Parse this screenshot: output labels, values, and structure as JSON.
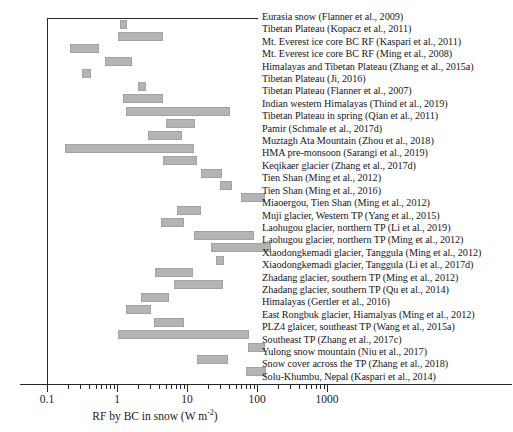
{
  "chart_data": {
    "type": "bar",
    "orientation": "horizontal",
    "title": "",
    "xlabel": "RF by BC in snow (W m-2)",
    "ylabel": "",
    "xscale": "log",
    "xlim": [
      0.1,
      1000
    ],
    "xticks": [
      0.1,
      1,
      10,
      100,
      1000
    ],
    "xticklabels": [
      "0.1",
      "1",
      "10",
      "100",
      "1000"
    ],
    "grid": false,
    "legend": "right-side study labels, one per row",
    "note": "Each row is a study; the bar spans the reported range of radiative forcing (W m-2).",
    "categories": [
      "Eurasia snow (Flanner et al., 2009)",
      "Tibetan Plateau (Kopacz et al., 2011)",
      "Mt. Everest ice core BC RF (Kaspari et al., 2011)",
      "Mt. Everest ice core BC RF (Ming et al., 2008)",
      "Himalayas and Tibetan Plateau (Zhang et al., 2015a)",
      "Tibetan Plateau (Ji, 2016)",
      "Tibetan Plateau (Flanner et al., 2007)",
      "Indian western Himalayas (Thind et al., 2019)",
      "Tibetan Plateau in spring (Qian et al., 2011)",
      "Pamir (Schmale et al., 2017d)",
      "Muztagh Ata Mountain (Zhou et al., 2018)",
      "HMA pre-monsoon (Sarangi et al., 2019)",
      "Keqikaer glacier (Zhang et al., 2017d)",
      "Tien Shan (Ming et al., 2012)",
      "Tien Shan (Ming et al., 2016)",
      "Miaoergou, Tien Shan (Ming et al., 2012)",
      "Muji glacier, Western TP (Yang et al., 2015)",
      "Laohugou glacier, northern TP (Li et al., 2019)",
      "Laohugou glacier, northern TP (Ming et al., 2012)",
      "Xiaodongkemadi glacier, Tanggula (Ming et al., 2012)",
      "Xiaodongkemadi glacier, Tanggula (Li et al., 2017d)",
      "Zhadang glacier, southern TP (Ming et al., 2012)",
      "Zhadang glacier, southern TP (Qu et al., 2014)",
      "Himalayas (Gertler et al., 2016)",
      "East Rongbuk glacier, Hiamalyas (Ming et al., 2012)",
      "PLZ4 glaicer, southeast TP (Wang et al., 2015a)",
      "Southeast TP (Zhang et al., 2017c)",
      "Yulong snow mountain (Niu et al., 2017)",
      "Snow cover across the TP (Zhang et al., 2018)",
      "Solu-Khumbu, Nepal (Kaspari et al., 2014)"
    ],
    "ranges": [
      [
        1.1,
        1.4
      ],
      [
        1.05,
        4.6
      ],
      [
        0.21,
        0.56
      ],
      [
        0.68,
        1.65
      ],
      [
        0.32,
        0.42
      ],
      [
        2.0,
        2.5
      ],
      [
        1.2,
        4.5
      ],
      [
        1.35,
        41.0
      ],
      [
        5.0,
        13.0
      ],
      [
        2.8,
        8.5
      ],
      [
        0.18,
        12.5
      ],
      [
        4.5,
        14.0
      ],
      [
        16.0,
        32.0
      ],
      [
        30.0,
        44.0
      ],
      [
        60.0,
        130.0
      ],
      [
        7.2,
        16.0
      ],
      [
        4.3,
        9.0
      ],
      [
        12.5,
        90.0
      ],
      [
        22.0,
        160.0
      ],
      [
        26.0,
        32.0
      ],
      [
        3.5,
        12.0
      ],
      [
        6.5,
        33.0
      ],
      [
        2.2,
        5.5
      ],
      [
        1.35,
        3.1
      ],
      [
        3.4,
        9.0
      ],
      [
        1.05,
        76.0
      ],
      [
        75.0,
        130.0
      ],
      [
        14.0,
        38.0
      ],
      [
        70.0,
        135.0
      ],
      [
        0.0,
        0.0
      ]
    ]
  },
  "axis": {
    "tick_labels": [
      "0.1",
      "1",
      "10",
      "100",
      "1000"
    ],
    "title_main": "RF by BC in snow (W m",
    "title_sup": "-2",
    "title_tail": ")"
  }
}
